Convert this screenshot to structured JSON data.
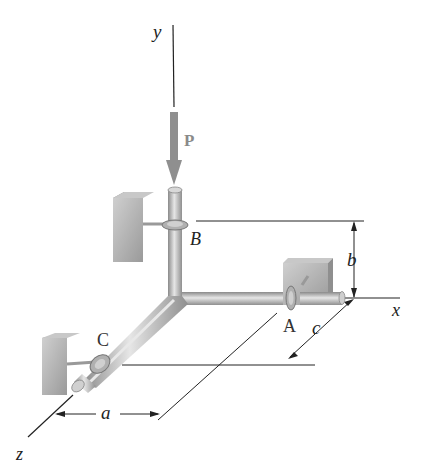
{
  "figure": {
    "axes": {
      "x": "x",
      "y": "y",
      "z": "z"
    },
    "force": {
      "label": "P",
      "color": "#8f8f8f"
    },
    "supports": {
      "A": "A",
      "B": "B",
      "C": "C"
    },
    "dimensions": {
      "a": "a",
      "b": "b",
      "c": "c"
    },
    "colors": {
      "pipe": "#b8b8b8",
      "pipe_dark": "#8a8a8a",
      "block": "#a9a9a9",
      "line": "#222222"
    }
  }
}
